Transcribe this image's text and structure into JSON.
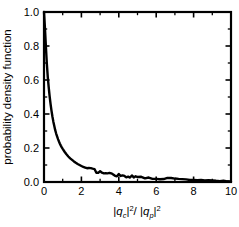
{
  "chart_data": {
    "type": "line",
    "title": "",
    "subtitle": "",
    "xlabel": "|q_c|^2/ |q_p|^2",
    "xlabel_parts": {
      "open1": "|",
      "var1": "q",
      "sub1": "c",
      "close1": "|",
      "exp1": "2",
      "slash": "/ ",
      "open2": "|",
      "var2": "q",
      "sub2": "p",
      "close2": "|",
      "exp2": "2"
    },
    "ylabel": "probability density function",
    "xlim": [
      0,
      10
    ],
    "ylim": [
      0.0,
      1.0
    ],
    "xticks": [
      0,
      2,
      4,
      6,
      8,
      10
    ],
    "xticklabels": [
      "0",
      "2",
      "4",
      "6",
      "8",
      "10"
    ],
    "xminorticks": [
      1,
      3,
      5,
      7,
      9
    ],
    "yticks": [
      0.0,
      0.2,
      0.4,
      0.6,
      0.8,
      1.0
    ],
    "yticklabels": [
      "0.0",
      "0.2",
      "0.4",
      "0.6",
      "0.8",
      "1.0"
    ],
    "yminorticks": [
      0.1,
      0.3,
      0.5,
      0.7,
      0.9
    ],
    "grid": false,
    "legend": null,
    "tick_direction": "in",
    "frame": "box",
    "line_color": "#000000",
    "line_width": 2.4,
    "series": [
      {
        "name": "probability density function",
        "x": [
          0.0,
          0.05,
          0.1,
          0.15,
          0.2,
          0.25,
          0.3,
          0.35,
          0.4,
          0.45,
          0.5,
          0.55,
          0.6,
          0.65,
          0.7,
          0.75,
          0.8,
          0.85,
          0.9,
          0.95,
          1.0,
          1.1,
          1.2,
          1.3,
          1.4,
          1.5,
          1.6,
          1.7,
          1.8,
          1.9,
          2.0,
          2.1,
          2.2,
          2.3,
          2.4,
          2.5,
          2.6,
          2.7,
          2.8,
          2.9,
          3.0,
          3.1,
          3.2,
          3.3,
          3.4,
          3.5,
          3.6,
          3.7,
          3.8,
          3.9,
          4.0,
          4.1,
          4.2,
          4.3,
          4.4,
          4.5,
          4.6,
          4.7,
          4.8,
          4.9,
          5.0,
          5.2,
          5.4,
          5.6,
          5.8,
          6.0,
          6.2,
          6.4,
          6.6,
          6.8,
          7.0,
          7.2,
          7.4,
          7.6,
          7.8,
          8.0,
          8.2,
          8.4,
          8.6,
          8.8,
          9.0,
          9.2,
          9.4,
          9.6,
          9.8,
          10.0
        ],
        "y": [
          1.0,
          0.905,
          0.8,
          0.7,
          0.62,
          0.56,
          0.505,
          0.46,
          0.42,
          0.385,
          0.355,
          0.33,
          0.305,
          0.285,
          0.268,
          0.252,
          0.238,
          0.225,
          0.214,
          0.204,
          0.195,
          0.178,
          0.163,
          0.15,
          0.139,
          0.13,
          0.121,
          0.113,
          0.106,
          0.1,
          0.094,
          0.089,
          0.085,
          0.081,
          0.077,
          0.074,
          0.07,
          0.066,
          0.063,
          0.06,
          0.058,
          0.054,
          0.052,
          0.049,
          0.048,
          0.047,
          0.045,
          0.044,
          0.043,
          0.042,
          0.04,
          0.038,
          0.036,
          0.035,
          0.034,
          0.033,
          0.032,
          0.031,
          0.03,
          0.029,
          0.028,
          0.027,
          0.025,
          0.024,
          0.023,
          0.022,
          0.021,
          0.02,
          0.019,
          0.018,
          0.017,
          0.016,
          0.015,
          0.014,
          0.013,
          0.012,
          0.011,
          0.01,
          0.009,
          0.008,
          0.008,
          0.007,
          0.006,
          0.005,
          0.004,
          0.003
        ]
      }
    ],
    "noise_note": "tail shows small high-frequency fluctuations from x~2.4 onward"
  }
}
